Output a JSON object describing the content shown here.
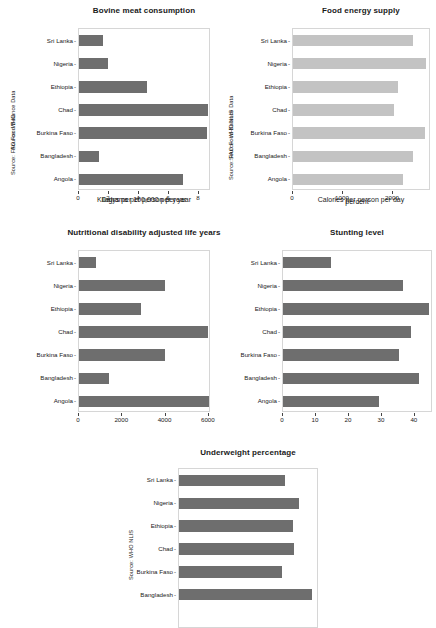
{
  "figure": {
    "background": "#ffffff",
    "bar_color_dark": "#6e6e6e",
    "bar_color_light": "#c3c3c3",
    "countries": [
      "Sri Lanka",
      "Nigeria",
      "Ethiopia",
      "Chad",
      "Burkina Faso",
      "Bangladesh",
      "Angola"
    ]
  },
  "chart_data": [
    {
      "id": "bovine-meat-consumption",
      "type": "bar",
      "orientation": "horizontal",
      "title": "Bovine meat consumption",
      "ylabel": "Source: FAO Food Balance Data",
      "xlabel": "Kilograms per person per year",
      "categories": [
        "Sri Lanka",
        "Nigeria",
        "Ethiopia",
        "Chad",
        "Burkina Faso",
        "Bangladesh",
        "Angola"
      ],
      "values": [
        1.6,
        1.9,
        4.5,
        8.6,
        8.5,
        1.3,
        6.9
      ],
      "xticks": [
        0,
        2,
        4,
        6,
        8
      ],
      "xticklabels": [
        "0",
        "2",
        "4",
        "6",
        "8"
      ],
      "xlim": [
        0,
        8.8
      ],
      "grid": false,
      "legend": "none",
      "bar_style": "dark"
    },
    {
      "id": "food-energy-supply",
      "type": "bar",
      "orientation": "horizontal",
      "title": "Food energy supply",
      "ylabel": "Source: FAO Food Balance Data",
      "xlabel": "Calories per person per day",
      "categories": [
        "Sri Lanka",
        "Nigeria",
        "Ethiopia",
        "Chad",
        "Burkina Faso",
        "Bangladesh",
        "Angola"
      ],
      "values": [
        2400,
        2650,
        2100,
        2010,
        2640,
        2400,
        2190
      ],
      "xticks": [
        0,
        1000,
        2000
      ],
      "xticklabels": [
        "0",
        "1000",
        "2000"
      ],
      "xlim": [
        0,
        2760
      ],
      "grid": false,
      "legend": "none",
      "bar_style": "light"
    },
    {
      "id": "nutritional-dalys",
      "type": "bar",
      "orientation": "horizontal",
      "title": "Nutritional disability adjusted life years",
      "ylabel": "Source: WHO",
      "xlabel": "Dalys per 100,000 per year",
      "categories": [
        "Sri Lanka",
        "Nigeria",
        "Ethiopia",
        "Chad",
        "Burkina Faso",
        "Bangladesh",
        "Angola"
      ],
      "values": [
        800,
        3980,
        2850,
        5980,
        3960,
        1400,
        6000
      ],
      "xticks": [
        0,
        2000,
        4000,
        6000
      ],
      "xticklabels": [
        "0",
        "2000",
        "4000",
        "6000"
      ],
      "xlim": [
        0,
        6100
      ],
      "grid": false,
      "legend": "none",
      "bar_style": "dark"
    },
    {
      "id": "stunting-level",
      "type": "bar",
      "orientation": "horizontal",
      "title": "Stunting level",
      "ylabel": "Source: WHO NLIS",
      "xlabel": "percent",
      "categories": [
        "Sri Lanka",
        "Nigeria",
        "Ethiopia",
        "Chad",
        "Burkina Faso",
        "Bangladesh",
        "Angola"
      ],
      "values": [
        14.7,
        36.4,
        44.4,
        38.7,
        35.1,
        41.3,
        29.2
      ],
      "xticks": [
        0,
        10,
        20,
        30,
        40
      ],
      "xticklabels": [
        "0",
        "10",
        "20",
        "30",
        "40"
      ],
      "xlim": [
        0,
        45.5
      ],
      "grid": false,
      "legend": "none",
      "bar_style": "dark"
    },
    {
      "id": "underweight-percentage",
      "type": "bar",
      "orientation": "horizontal",
      "title": "Underweight percentage",
      "ylabel": "Source: WHO NLIS",
      "xlabel": "",
      "categories": [
        "Sri Lanka",
        "Nigeria",
        "Ethiopia",
        "Chad",
        "Burkina Faso",
        "Bangladesh",
        "Angola"
      ],
      "values": [
        21.1,
        24.0,
        22.8,
        23.0,
        20.5,
        26.5,
        null
      ],
      "xticks": [],
      "xticklabels": [],
      "xlim": [
        0,
        28
      ],
      "grid": false,
      "legend": "none",
      "bar_style": "dark",
      "note": "panel is cropped by the bottom edge of the screenshot; x-axis and Angola row not visible"
    }
  ]
}
